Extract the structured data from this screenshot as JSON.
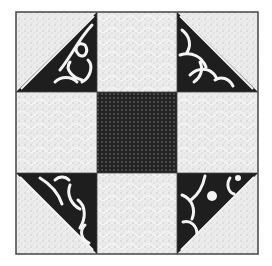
{
  "figure": {
    "type": "quilt-block",
    "pattern_description": "3x3 quilt block with dark center square, light patterned side squares and half-square-triangle corners",
    "colors": {
      "background": "#ffffff",
      "light_fabric": "#ececec",
      "light_speckle": "#9a9a9a",
      "dark_fabric": "#222222",
      "dark_dots": "#8a8a8a",
      "floral_dark": "#1e1e1e",
      "floral_light": "#f4f4f4",
      "outline": "#444444"
    },
    "grid": {
      "cols": [
        16,
        97,
        177,
        258
      ],
      "rows": [
        12,
        92,
        173,
        254
      ]
    },
    "corners": [
      {
        "name": "top-left",
        "dark_triangle": "lower-right"
      },
      {
        "name": "top-right",
        "dark_triangle": "lower-left"
      },
      {
        "name": "bottom-left",
        "dark_triangle": "upper-right"
      },
      {
        "name": "bottom-right",
        "dark_triangle": "upper-left"
      }
    ]
  }
}
